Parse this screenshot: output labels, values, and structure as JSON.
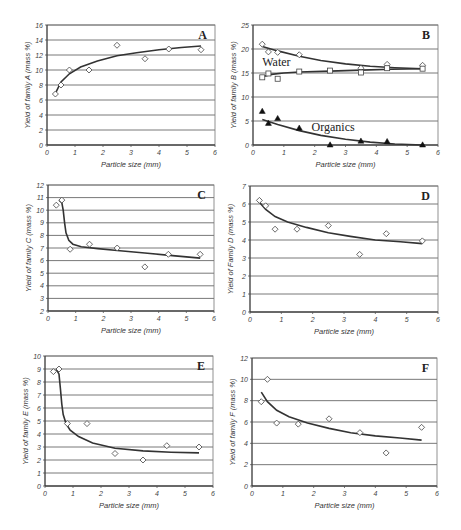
{
  "chart_data": [
    {
      "id": "A",
      "type": "scatter",
      "panel_label": "A",
      "xlabel": "Particle size (mm)",
      "ylabel": "Yield of family A (mass %)",
      "xlim": [
        0,
        6
      ],
      "ylim": [
        0,
        16
      ],
      "xticks": [
        0,
        1,
        2,
        3,
        4,
        5,
        6
      ],
      "yticks": [
        0,
        2,
        4,
        6,
        8,
        10,
        12,
        14,
        16
      ],
      "grid": "horizontal",
      "box": {
        "x0": 47,
        "x1": 215,
        "y0": 145,
        "y1": 25
      },
      "series": [
        {
          "name": "family A",
          "marker": "diamond",
          "x": [
            0.3,
            0.5,
            0.8,
            1.5,
            2.5,
            3.5,
            4.35,
            5.5
          ],
          "y": [
            6.8,
            8.0,
            10.0,
            10.0,
            13.3,
            11.5,
            12.8,
            12.7
          ],
          "fit": {
            "x": [
              0.3,
              0.5,
              0.8,
              1.2,
              1.8,
              2.5,
              3.2,
              4.0,
              4.8,
              5.5
            ],
            "y": [
              6.9,
              8.4,
              9.5,
              10.4,
              11.2,
              11.9,
              12.3,
              12.7,
              13.0,
              13.2
            ]
          }
        }
      ]
    },
    {
      "id": "B",
      "type": "scatter",
      "panel_label": "B",
      "xlabel": "Particle size (mm)",
      "ylabel": "Yield of family B (mass %)",
      "xlim": [
        0,
        6
      ],
      "ylim": [
        0,
        25
      ],
      "xticks": [
        0,
        1,
        2,
        3,
        4,
        5,
        6
      ],
      "yticks": [
        0,
        5,
        10,
        15,
        20,
        25
      ],
      "grid": "horizontal",
      "box": {
        "x0": 253,
        "x1": 438,
        "y0": 145,
        "y1": 25
      },
      "annotations": [
        {
          "text": "Water",
          "x": 0.3,
          "y": 16.5
        },
        {
          "text": "Organics",
          "x": 1.9,
          "y": 3.0
        }
      ],
      "series": [
        {
          "name": "Water (upper)",
          "marker": "diamond",
          "x": [
            0.3,
            0.5,
            0.8,
            1.5,
            3.5,
            4.35,
            5.5
          ],
          "y": [
            21.0,
            19.4,
            19.3,
            18.8,
            16.0,
            16.8,
            16.6
          ],
          "fit": {
            "x": [
              0.3,
              0.8,
              1.5,
              2.2,
              3.0,
              3.8,
              4.6,
              5.5
            ],
            "y": [
              20.5,
              19.6,
              18.5,
              17.6,
              16.9,
              16.4,
              16.1,
              15.9
            ]
          }
        },
        {
          "name": "Water (lower)",
          "marker": "square",
          "x": [
            0.3,
            0.5,
            0.8,
            1.5,
            2.5,
            3.5,
            4.35,
            5.5
          ],
          "y": [
            14.1,
            14.9,
            13.8,
            15.3,
            15.5,
            15.1,
            16.0,
            15.9
          ],
          "fit": {
            "x": [
              0.3,
              0.6,
              1.0,
              1.5,
              2.5,
              3.5,
              4.5,
              5.5
            ],
            "y": [
              14.2,
              14.7,
              15.0,
              15.2,
              15.4,
              15.6,
              15.8,
              15.9
            ]
          }
        },
        {
          "name": "Organics",
          "marker": "triangle",
          "x": [
            0.3,
            0.5,
            0.8,
            1.5,
            2.5,
            3.5,
            4.35,
            5.5
          ],
          "y": [
            7.0,
            4.5,
            5.5,
            3.5,
            0.0,
            0.8,
            0.7,
            0.0
          ],
          "fit": {
            "x": [
              0.3,
              0.8,
              1.5,
              2.2,
              3.0,
              3.8,
              4.6,
              5.5
            ],
            "y": [
              5.3,
              4.3,
              3.0,
              2.0,
              1.2,
              0.6,
              0.2,
              0.0
            ]
          }
        }
      ]
    },
    {
      "id": "C",
      "type": "scatter",
      "panel_label": "C",
      "xlabel": "Particle size (mm)",
      "ylabel": "Yield of family C (mass %)",
      "xlim": [
        0,
        6
      ],
      "ylim": [
        2,
        12
      ],
      "xticks": [
        0,
        1,
        2,
        3,
        4,
        5,
        6
      ],
      "yticks": [
        2,
        3,
        4,
        5,
        6,
        7,
        8,
        9,
        10,
        11,
        12
      ],
      "grid": "horizontal",
      "box": {
        "x0": 48,
        "x1": 214,
        "y0": 311,
        "y1": 185
      },
      "series": [
        {
          "name": "family C",
          "marker": "diamond",
          "x": [
            0.3,
            0.5,
            0.8,
            1.5,
            2.5,
            3.5,
            4.35,
            5.5
          ],
          "y": [
            10.4,
            10.8,
            6.9,
            7.3,
            7.0,
            5.5,
            6.5,
            6.5
          ],
          "fit": {
            "x": [
              0.4,
              0.5,
              0.55,
              0.6,
              0.65,
              0.75,
              0.9,
              1.2,
              1.8,
              2.5,
              3.5,
              4.5,
              5.5
            ],
            "y": [
              10.8,
              10.6,
              10.0,
              9.0,
              8.2,
              7.6,
              7.3,
              7.1,
              6.95,
              6.8,
              6.6,
              6.4,
              6.2
            ]
          }
        }
      ]
    },
    {
      "id": "D",
      "type": "scatter",
      "panel_label": "D",
      "xlabel": "Particle size (mm)",
      "ylabel": "Yield of Family D (mass %)",
      "xlim": [
        0,
        6
      ],
      "ylim": [
        0,
        7
      ],
      "xticks": [
        0,
        1,
        2,
        3,
        4,
        5,
        6
      ],
      "yticks": [
        0,
        1,
        2,
        3,
        4,
        5,
        6,
        7
      ],
      "grid": "horizontal",
      "box": {
        "x0": 250,
        "x1": 438,
        "y0": 312,
        "y1": 186
      },
      "series": [
        {
          "name": "family D",
          "marker": "diamond",
          "x": [
            0.3,
            0.5,
            0.8,
            1.5,
            2.5,
            3.5,
            4.35,
            5.5
          ],
          "y": [
            6.2,
            5.9,
            4.6,
            4.6,
            4.8,
            3.2,
            4.35,
            3.95
          ],
          "fit": {
            "x": [
              0.3,
              0.5,
              0.8,
              1.2,
              1.8,
              2.5,
              3.2,
              4.0,
              4.8,
              5.5
            ],
            "y": [
              6.1,
              5.7,
              5.3,
              5.0,
              4.7,
              4.4,
              4.2,
              4.0,
              3.9,
              3.8
            ]
          }
        }
      ]
    },
    {
      "id": "E",
      "type": "scatter",
      "panel_label": "E",
      "xlabel": "Particle size (mm)",
      "ylabel": "Yield of family E (mass %)",
      "xlim": [
        0,
        6
      ],
      "ylim": [
        0,
        10
      ],
      "xticks": [
        0,
        1,
        2,
        3,
        4,
        5,
        6
      ],
      "yticks": [
        0,
        1,
        2,
        3,
        4,
        5,
        6,
        7,
        8,
        9,
        10
      ],
      "grid": "horizontal",
      "box": {
        "x0": 45,
        "x1": 213,
        "y0": 486,
        "y1": 356
      },
      "series": [
        {
          "name": "family E",
          "marker": "diamond",
          "x": [
            0.3,
            0.5,
            0.8,
            1.5,
            2.5,
            3.5,
            4.35,
            5.5
          ],
          "y": [
            8.8,
            9.0,
            4.8,
            4.8,
            2.5,
            2.0,
            3.1,
            3.0
          ],
          "fit": {
            "x": [
              0.4,
              0.5,
              0.55,
              0.6,
              0.65,
              0.75,
              0.9,
              1.2,
              1.7,
              2.5,
              3.5,
              4.5,
              5.5
            ],
            "y": [
              9.0,
              8.6,
              7.5,
              6.3,
              5.5,
              4.8,
              4.3,
              3.8,
              3.3,
              2.9,
              2.7,
              2.6,
              2.55
            ]
          }
        }
      ]
    },
    {
      "id": "F",
      "type": "scatter",
      "panel_label": "F",
      "xlabel": "Particle size (mm)",
      "ylabel": "Yield of family F (mass %)",
      "xlim": [
        0,
        6
      ],
      "ylim": [
        0,
        12
      ],
      "xticks": [
        0,
        1,
        2,
        3,
        4,
        5,
        6
      ],
      "yticks": [
        0,
        2,
        4,
        6,
        8,
        10,
        12
      ],
      "grid": "horizontal",
      "box": {
        "x0": 252,
        "x1": 437,
        "y0": 486,
        "y1": 358
      },
      "series": [
        {
          "name": "family F",
          "marker": "diamond",
          "x": [
            0.3,
            0.5,
            0.8,
            1.5,
            2.5,
            3.5,
            4.35,
            5.5
          ],
          "y": [
            7.9,
            10.0,
            5.9,
            5.8,
            6.3,
            5.0,
            3.1,
            5.5
          ],
          "fit": {
            "x": [
              0.3,
              0.5,
              0.8,
              1.2,
              1.8,
              2.5,
              3.2,
              4.0,
              4.8,
              5.5
            ],
            "y": [
              8.8,
              7.9,
              7.1,
              6.5,
              5.9,
              5.4,
              5.0,
              4.7,
              4.5,
              4.3
            ]
          }
        }
      ]
    }
  ],
  "style": {
    "line_color": "#333333",
    "grid_color": "#555555",
    "marker_stroke": "#444444",
    "marker_fill": "#ffffff",
    "filled_marker": "#111111"
  }
}
